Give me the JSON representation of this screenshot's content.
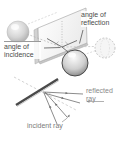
{
  "figure": {
    "top_diagram": {
      "angle_of_incidence_label": "angle of incidence",
      "angle_of_reflection_label": "angle of reflection"
    },
    "bottom_diagram": {
      "reflected_ray_label": "reflected ray",
      "incident_ray_label": "incident ray"
    },
    "colors": {
      "background": "#ffffff",
      "mirror_face": "#f6f6f6",
      "mirror_edge": "#cfcfcf",
      "mirror_line_dark": "#4a4a4a",
      "ray_gray": "#6e6e6e",
      "dashed_gray": "#bdbdbd",
      "label_dark": "#4a4a4a",
      "label_gray": "#8a8a8a"
    }
  }
}
